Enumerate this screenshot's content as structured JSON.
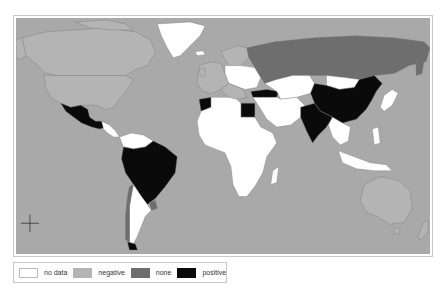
{
  "map": {
    "type": "choropleth-world",
    "ocean_color": "#a9a9a9",
    "border_color": "#777777",
    "categories": {
      "no_data": "#ffffff",
      "negative": "#b4b4b4",
      "none": "#6e6e6e",
      "positive": "#0a0a0a"
    },
    "regions": [
      {
        "name": "Greenland",
        "category": "no_data"
      },
      {
        "name": "Canada",
        "category": "negative"
      },
      {
        "name": "United States",
        "category": "negative"
      },
      {
        "name": "Mexico",
        "category": "positive"
      },
      {
        "name": "Central America",
        "category": "no_data"
      },
      {
        "name": "Colombia/Venezuela",
        "category": "no_data"
      },
      {
        "name": "Brazil",
        "category": "positive"
      },
      {
        "name": "Peru/Bolivia",
        "category": "positive"
      },
      {
        "name": "Argentina",
        "category": "no_data"
      },
      {
        "name": "Chile",
        "category": "none"
      },
      {
        "name": "Uruguay",
        "category": "none"
      },
      {
        "name": "Western Europe",
        "category": "negative"
      },
      {
        "name": "Eastern Europe",
        "category": "no_data"
      },
      {
        "name": "Russia",
        "category": "none"
      },
      {
        "name": "Morocco",
        "category": "positive"
      },
      {
        "name": "Egypt",
        "category": "positive"
      },
      {
        "name": "Turkey",
        "category": "positive"
      },
      {
        "name": "Africa",
        "category": "no_data"
      },
      {
        "name": "Middle East",
        "category": "no_data"
      },
      {
        "name": "Central Asia",
        "category": "no_data"
      },
      {
        "name": "Mongolia",
        "category": "no_data"
      },
      {
        "name": "China",
        "category": "positive"
      },
      {
        "name": "India",
        "category": "positive"
      },
      {
        "name": "Southeast Asia",
        "category": "no_data"
      },
      {
        "name": "Japan",
        "category": "no_data"
      },
      {
        "name": "Indonesia",
        "category": "no_data"
      },
      {
        "name": "Australia",
        "category": "negative"
      },
      {
        "name": "New Zealand",
        "category": "negative"
      }
    ]
  },
  "legend": {
    "items": [
      {
        "key": "no_data",
        "label": "no data",
        "color": "#ffffff"
      },
      {
        "key": "negative",
        "label": "negative",
        "color": "#b4b4b4"
      },
      {
        "key": "none",
        "label": "none",
        "color": "#6e6e6e"
      },
      {
        "key": "positive",
        "label": "positive",
        "color": "#0a0a0a"
      }
    ]
  }
}
